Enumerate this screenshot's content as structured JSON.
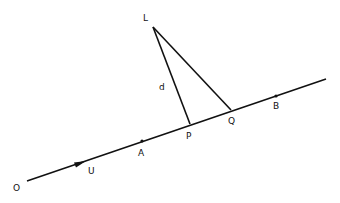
{
  "diagram": {
    "type": "geometry",
    "colors": {
      "stroke": "#111111",
      "background": "#ffffff"
    },
    "line": {
      "start": [
        27,
        181
      ],
      "end": [
        326,
        79
      ],
      "direction_label": "U"
    },
    "points": [
      {
        "id": "O",
        "label": "O",
        "pos": [
          27,
          181
        ],
        "label_pos": [
          13,
          191
        ]
      },
      {
        "id": "U",
        "label": "U",
        "pos": [
          80,
          163
        ],
        "label_pos": [
          88,
          174
        ]
      },
      {
        "id": "A",
        "label": "A",
        "pos": [
          142,
          141
        ],
        "label_pos": [
          138,
          156
        ]
      },
      {
        "id": "P",
        "label": "P",
        "pos": [
          190,
          124
        ],
        "label_pos": [
          186,
          139
        ]
      },
      {
        "id": "Q",
        "label": "Q",
        "pos": [
          231,
          110
        ],
        "label_pos": [
          228,
          124
        ]
      },
      {
        "id": "B",
        "label": "B",
        "pos": [
          276,
          96
        ],
        "label_pos": [
          273,
          109
        ]
      },
      {
        "id": "L",
        "label": "L",
        "pos": [
          153,
          27
        ],
        "label_pos": [
          143,
          21
        ]
      }
    ],
    "segments": [
      {
        "from": "L",
        "to": "P",
        "label": "d",
        "label_pos": [
          159,
          90
        ]
      },
      {
        "from": "L",
        "to": "Q",
        "label": ""
      }
    ]
  }
}
